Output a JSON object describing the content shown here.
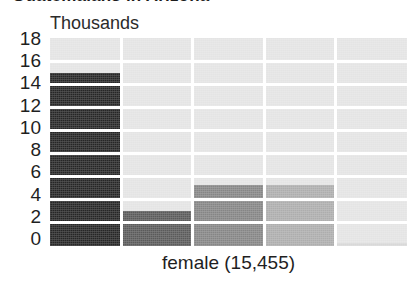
{
  "chart_data": {
    "type": "bar",
    "title": "Guatemalans in Arizona",
    "subtitle": "",
    "unit_label": "Thousands",
    "xlabel": "female (15,455)",
    "ylabel": "",
    "categories": [
      "1",
      "2",
      "3",
      "4",
      "5"
    ],
    "values": [
      15.0,
      3.0,
      5.3,
      5.3,
      0.3
    ],
    "bar_colors": [
      "#262626",
      "#5a5a5a",
      "#858585",
      "#adadad",
      "#d8d8d8"
    ],
    "ylim": [
      0,
      18
    ],
    "ytick_values": [
      18,
      16,
      14,
      12,
      10,
      8,
      6,
      4,
      2,
      0
    ],
    "ytick_labels": [
      "18",
      "16",
      "14",
      "12",
      "10",
      "8",
      "6",
      "4",
      "2",
      "0"
    ],
    "grid": true,
    "grid_color": "#ffffff",
    "plot_background": "#e4e4e4",
    "legend": "none",
    "legend_position": "none",
    "annotations": []
  },
  "axis": {
    "y_ticks": [
      {
        "label": "18",
        "value": 18
      },
      {
        "label": "16",
        "value": 16
      },
      {
        "label": "14",
        "value": 14
      },
      {
        "label": "12",
        "value": 12
      },
      {
        "label": "10",
        "value": 10
      },
      {
        "label": "8",
        "value": 8
      },
      {
        "label": "6",
        "value": 6
      },
      {
        "label": "4",
        "value": 4
      },
      {
        "label": "2",
        "value": 2
      },
      {
        "label": "0",
        "value": 0
      }
    ]
  },
  "labels": {
    "title": "Guatemalans in Arizona",
    "unit": "Thousands",
    "x_axis": "female (15,455)"
  }
}
